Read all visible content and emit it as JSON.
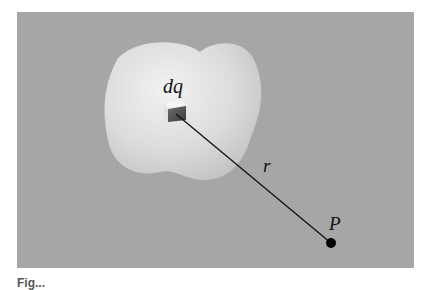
{
  "figure": {
    "labels": {
      "charge_element": "dq",
      "distance": "r",
      "point": "P"
    },
    "caption": "Fig..."
  },
  "colors": {
    "background": "#a6a6a6",
    "body": "#e6e6e6",
    "line": "#111111",
    "point": "#000000"
  }
}
